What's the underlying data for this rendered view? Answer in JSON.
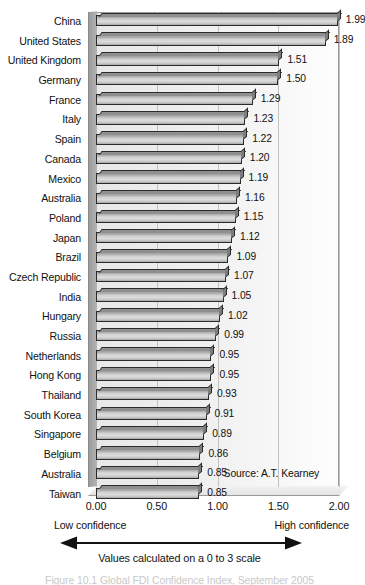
{
  "chart_data": {
    "type": "bar",
    "orientation": "horizontal",
    "title": "",
    "xlabel": "Values calculated on a 0 to 3 scale",
    "ylabel": "",
    "xlim": [
      0.0,
      2.0
    ],
    "xticks": [
      "0.00",
      "0.50",
      "1.00",
      "1.50",
      "2.00"
    ],
    "xtick_values": [
      0.0,
      0.5,
      1.0,
      1.5,
      2.0
    ],
    "grid": "vertical",
    "legend": "none",
    "categories": [
      "China",
      "United States",
      "United Kingdom",
      "Germany",
      "France",
      "Italy",
      "Spain",
      "Canada",
      "Mexico",
      "Australia",
      "Poland",
      "Japan",
      "Brazil",
      "Czech Republic",
      "India",
      "Hungary",
      "Russia",
      "Netherlands",
      "Hong Kong",
      "Thailand",
      "South Korea",
      "Singapore",
      "Belgium",
      "Australia",
      "Taiwan"
    ],
    "values": [
      1.99,
      1.89,
      1.51,
      1.5,
      1.29,
      1.23,
      1.22,
      1.2,
      1.19,
      1.16,
      1.15,
      1.12,
      1.09,
      1.07,
      1.05,
      1.02,
      0.99,
      0.95,
      0.95,
      0.93,
      0.91,
      0.89,
      0.86,
      0.85,
      0.85
    ],
    "value_labels": [
      "1.99",
      "1.89",
      "1.51",
      "1.50",
      "1.29",
      "1.23",
      "1.22",
      "1.20",
      "1.19",
      "1.16",
      "1.15",
      "1.12",
      "1.09",
      "1.07",
      "1.05",
      "1.02",
      "0.99",
      "0.95",
      "0.95",
      "0.93",
      "0.91",
      "0.89",
      "0.86",
      "0.85",
      "0.85"
    ],
    "annotations": {
      "source": "Source: A.T. Kearney",
      "low_confidence": "Low confidence",
      "high_confidence": "High confidence",
      "scale_caption": "Values calculated on a 0 to 3 scale",
      "figure_caption_cutoff": "Figure 10.1   Global FDI Confidence Index, September 2005"
    },
    "colors": {
      "bar_face": "#d2d2d2",
      "bar_outline": "#2b2b2b",
      "bar_top_face": "#8f8f8f",
      "bar_side_face": "#7d7d7d",
      "plot_background": "#eeeeee",
      "gridline": "#c2c2c2",
      "text": "#111111"
    }
  }
}
